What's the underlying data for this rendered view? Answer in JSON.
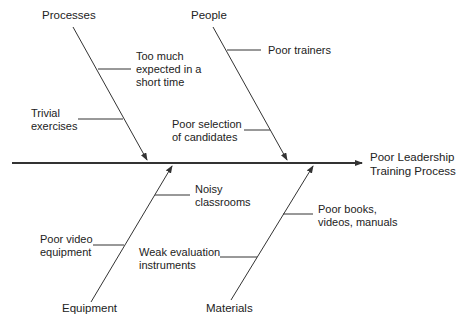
{
  "effect": {
    "line1": "Poor Leadership",
    "line2": "Training Process"
  },
  "categories": {
    "processes": {
      "label": "Processes",
      "causes": [
        {
          "lines": [
            "Too much",
            "expected in a",
            "short time"
          ]
        },
        {
          "lines": [
            "Trivial",
            "exercises"
          ]
        }
      ]
    },
    "people": {
      "label": "People",
      "causes": [
        {
          "lines": [
            "Poor trainers"
          ]
        },
        {
          "lines": [
            "Poor selection",
            "of candidates"
          ]
        }
      ]
    },
    "equipment": {
      "label": "Equipment",
      "causes": [
        {
          "lines": [
            "Noisy",
            "classrooms"
          ]
        },
        {
          "lines": [
            "Poor video",
            "equipment"
          ]
        }
      ]
    },
    "materials": {
      "label": "Materials",
      "causes": [
        {
          "lines": [
            "Poor books,",
            "videos, manuals"
          ]
        },
        {
          "lines": [
            "Weak evaluation",
            "instruments"
          ]
        }
      ]
    }
  },
  "colors": {
    "line": "#333333",
    "text": "#222222",
    "background": "#ffffff"
  }
}
